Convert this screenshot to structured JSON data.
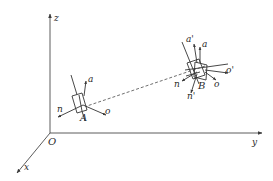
{
  "diagram": {
    "type": "3d-coordinate-frames",
    "axes": {
      "x_label": "x",
      "y_label": "y",
      "z_label": "z",
      "origin_label": "O"
    },
    "frame_A": {
      "label": "A",
      "axes": {
        "n": "n",
        "o": "o",
        "a": "a"
      }
    },
    "frame_B": {
      "label": "B",
      "axes": {
        "n": "n",
        "o": "o",
        "a": "a"
      },
      "rotated_axes": {
        "n": "n'",
        "o": "o'",
        "a": "a'"
      }
    },
    "path": {
      "style": "dashed",
      "from": "A",
      "to": "B"
    },
    "colors": {
      "line": "#3a3a3a",
      "background": "#ffffff"
    }
  }
}
